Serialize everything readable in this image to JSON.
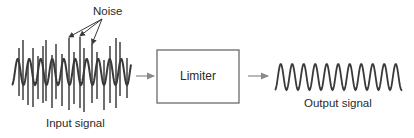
{
  "diagram": {
    "labels": {
      "noise": "Noise",
      "input_signal": "Input signal",
      "limiter": "Limiter",
      "output_signal": "Output signal"
    },
    "blocks": [
      {
        "id": "limiter",
        "label": "Limiter",
        "x": 157,
        "y": 50,
        "w": 82,
        "h": 53
      }
    ],
    "connections": [
      {
        "from": "input_signal",
        "to": "limiter"
      },
      {
        "from": "limiter",
        "to": "output_signal"
      }
    ],
    "colors": {
      "stroke": "#4a4a4a",
      "arrow": "#8a8a8a",
      "text": "#2a2a2a"
    },
    "input_wave": {
      "x_start": 12,
      "x_end": 131,
      "center_y": 72,
      "amplitude": 13,
      "period": 11.5
    },
    "output_wave": {
      "x_start": 275,
      "x_end": 402,
      "center_y": 77,
      "amplitude": 13,
      "period": 11.5
    },
    "noise_spikes": [
      {
        "x": 19,
        "y1": 48,
        "y2": 96
      },
      {
        "x": 23,
        "y1": 40,
        "y2": 100
      },
      {
        "x": 28,
        "y1": 62,
        "y2": 105
      },
      {
        "x": 33,
        "y1": 48,
        "y2": 107
      },
      {
        "x": 38,
        "y1": 56,
        "y2": 99
      },
      {
        "x": 43,
        "y1": 46,
        "y2": 103
      },
      {
        "x": 46,
        "y1": 40,
        "y2": 101
      },
      {
        "x": 52,
        "y1": 55,
        "y2": 108
      },
      {
        "x": 56,
        "y1": 44,
        "y2": 99
      },
      {
        "x": 62,
        "y1": 54,
        "y2": 106
      },
      {
        "x": 69,
        "y1": 38,
        "y2": 110
      },
      {
        "x": 74,
        "y1": 52,
        "y2": 104
      },
      {
        "x": 80,
        "y1": 37,
        "y2": 108
      },
      {
        "x": 84,
        "y1": 48,
        "y2": 112
      },
      {
        "x": 92,
        "y1": 44,
        "y2": 103
      },
      {
        "x": 97,
        "y1": 52,
        "y2": 99
      },
      {
        "x": 104,
        "y1": 60,
        "y2": 110
      },
      {
        "x": 110,
        "y1": 46,
        "y2": 103
      },
      {
        "x": 116,
        "y1": 38,
        "y2": 108
      },
      {
        "x": 120,
        "y1": 42,
        "y2": 96
      },
      {
        "x": 127,
        "y1": 58,
        "y2": 98
      }
    ],
    "noise_pointers": [
      {
        "from": [
          102,
          19
        ],
        "to": [
          69,
          37
        ]
      },
      {
        "from": [
          102,
          19
        ],
        "to": [
          80,
          36
        ]
      },
      {
        "from": [
          102,
          19
        ],
        "to": [
          92,
          44
        ]
      }
    ]
  }
}
